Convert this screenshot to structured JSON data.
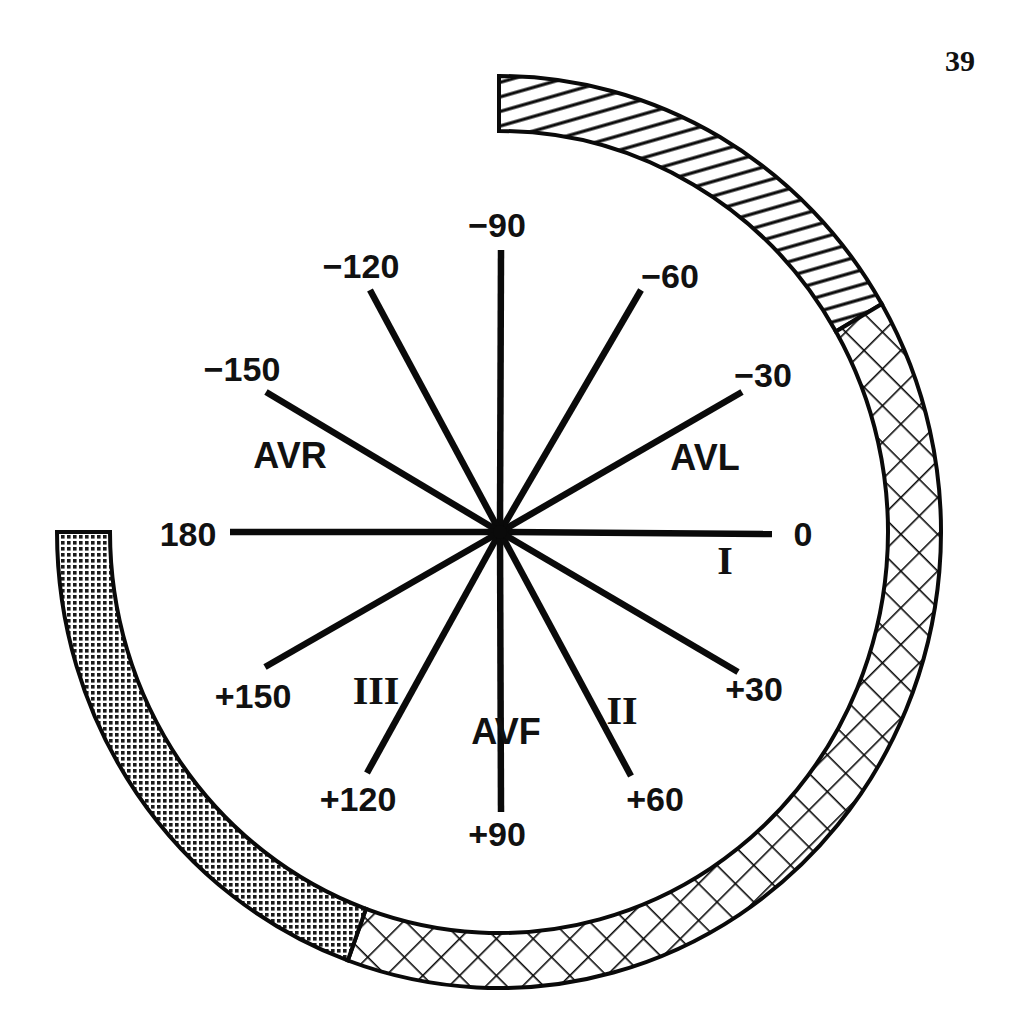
{
  "page": {
    "page_number": "39"
  },
  "diagram": {
    "center": [
      500,
      532
    ],
    "axes": [
      {
        "angle": 0,
        "label": "0",
        "end": [
          772,
          534
        ],
        "label_pos": [
          803,
          546
        ]
      },
      {
        "angle": -30,
        "label": "−30",
        "end": [
          742,
          392
        ],
        "label_pos": [
          763,
          387
        ]
      },
      {
        "angle": -60,
        "label": "−60",
        "end": [
          641,
          290
        ],
        "label_pos": [
          670,
          288
        ]
      },
      {
        "angle": -90,
        "label": "−90",
        "end": [
          501,
          250
        ],
        "label_pos": [
          497,
          237
        ]
      },
      {
        "angle": -120,
        "label": "−120",
        "end": [
          370,
          290
        ],
        "label_pos": [
          361,
          278
        ]
      },
      {
        "angle": -150,
        "label": "−150",
        "end": [
          266,
          392
        ],
        "label_pos": [
          242,
          381
        ]
      },
      {
        "angle": 180,
        "label": "180",
        "end": [
          230,
          532
        ],
        "label_pos": [
          188,
          546
        ]
      },
      {
        "angle": 150,
        "label": "+150",
        "end": [
          265,
          667
        ],
        "label_pos": [
          253,
          708
        ]
      },
      {
        "angle": 120,
        "label": "+120",
        "end": [
          367,
          773
        ],
        "label_pos": [
          358,
          811
        ]
      },
      {
        "angle": 90,
        "label": "+90",
        "end": [
          501,
          812
        ],
        "label_pos": [
          497,
          846
        ]
      },
      {
        "angle": 60,
        "label": "+60",
        "end": [
          631,
          776
        ],
        "label_pos": [
          655,
          811
        ]
      },
      {
        "angle": 30,
        "label": "+30",
        "end": [
          738,
          672
        ],
        "label_pos": [
          754,
          701
        ]
      }
    ],
    "leads": [
      {
        "name": "AVR",
        "type": "sans",
        "pos": [
          290,
          468
        ]
      },
      {
        "name": "AVL",
        "type": "sans",
        "pos": [
          705,
          470
        ]
      },
      {
        "name": "AVF",
        "type": "sans",
        "pos": [
          506,
          744
        ]
      },
      {
        "name": "I",
        "type": "roman",
        "pos": [
          725,
          574
        ]
      },
      {
        "name": "II",
        "type": "roman",
        "pos": [
          622,
          724
        ]
      },
      {
        "name": "III",
        "type": "roman",
        "pos": [
          376,
          704
        ]
      }
    ],
    "arc_bands": [
      {
        "name": "left-axis-deviation-band",
        "pattern": "diagonal-hatch",
        "start_angle": -90,
        "end_angle": -30
      },
      {
        "name": "normal-axis-band",
        "pattern": "crosshatch",
        "start_angle": -30,
        "end_angle": 110
      },
      {
        "name": "right-axis-deviation-band",
        "pattern": "dotted",
        "start_angle": 110,
        "end_angle": 180
      }
    ],
    "arc_geometry": {
      "cx": 499,
      "cy": 532,
      "outer_rx": 442,
      "outer_ry": 456,
      "inner_rx": 389,
      "inner_ry": 401
    },
    "colors": {
      "ink": "#0a0a0a",
      "paper": "#ffffff"
    }
  }
}
